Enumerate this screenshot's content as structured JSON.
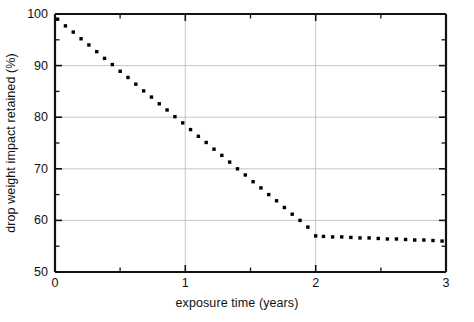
{
  "chart_data": {
    "type": "line",
    "title": "",
    "subtitle": "",
    "xlabel": "exposure time (years)",
    "ylabel": "drop weight impact retained (%)",
    "xlim": [
      0,
      3
    ],
    "ylim": [
      50,
      100
    ],
    "grid": true,
    "legend": "none",
    "marker": "dotted",
    "line_style": "dotted",
    "series_color": "#000000",
    "x_major_ticks": [
      0,
      1,
      2,
      3
    ],
    "x_minor_ticks": [
      0.5,
      1.5,
      2.5
    ],
    "y_major_ticks": [
      50,
      60,
      70,
      80,
      90,
      100
    ],
    "y_minor_ticks": [
      55,
      65,
      75,
      85,
      95
    ],
    "x_tick_labels": [
      "0",
      "1",
      "2",
      "3"
    ],
    "y_tick_labels": [
      "50",
      "60",
      "70",
      "80",
      "90",
      "100"
    ],
    "gridlines_y": [
      60,
      70,
      80,
      90
    ],
    "gridlines_x": [
      1,
      2
    ],
    "series": [
      {
        "name": "drop weight impact retained",
        "x": [
          0.02,
          0.08,
          0.14,
          0.2,
          0.26,
          0.32,
          0.38,
          0.44,
          0.5,
          0.56,
          0.62,
          0.68,
          0.74,
          0.8,
          0.86,
          0.92,
          0.98,
          1.04,
          1.1,
          1.16,
          1.22,
          1.28,
          1.34,
          1.4,
          1.46,
          1.52,
          1.58,
          1.64,
          1.7,
          1.76,
          1.82,
          1.88,
          1.94,
          2.0,
          2.06,
          2.13,
          2.2,
          2.27,
          2.34,
          2.41,
          2.48,
          2.55,
          2.62,
          2.69,
          2.76,
          2.83,
          2.9,
          2.97
        ],
        "y": [
          99.0,
          97.7,
          96.5,
          95.2,
          94.0,
          92.7,
          91.4,
          90.2,
          88.9,
          87.7,
          86.4,
          85.1,
          83.9,
          82.6,
          81.4,
          80.1,
          78.9,
          77.6,
          76.3,
          75.1,
          73.8,
          72.6,
          71.3,
          70.0,
          68.8,
          67.5,
          66.3,
          65.0,
          63.8,
          62.5,
          61.2,
          60.0,
          58.7,
          57.0,
          56.9,
          56.8,
          56.8,
          56.7,
          56.6,
          56.6,
          56.5,
          56.4,
          56.4,
          56.3,
          56.2,
          56.2,
          56.1,
          56.0
        ]
      }
    ],
    "annotations": []
  },
  "axes": {
    "x_title": "exposure time (years)",
    "y_title": "drop weight impact retained (%)"
  }
}
